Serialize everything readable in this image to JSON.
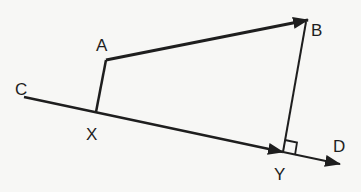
{
  "diagram": {
    "type": "geometry",
    "points": {
      "A": {
        "label": "A",
        "x": 106,
        "y": 60,
        "lx": 96,
        "ly": 51
      },
      "B": {
        "label": "B",
        "x": 308,
        "y": 20,
        "lx": 311,
        "ly": 36
      },
      "C": {
        "label": "C",
        "x": 24,
        "y": 97,
        "lx": 15,
        "ly": 95
      },
      "X": {
        "label": "X",
        "x": 96,
        "y": 112,
        "lx": 86,
        "ly": 140
      },
      "Y": {
        "label": "Y",
        "x": 283,
        "y": 152,
        "lx": 274,
        "ly": 180
      },
      "D": {
        "label": "D",
        "x": 340,
        "y": 164,
        "lx": 333,
        "ly": 152
      }
    },
    "segments": [
      {
        "from": "X",
        "to": "A",
        "arrow": false,
        "name": "segment-XA"
      },
      {
        "from": "A",
        "to": "B",
        "arrow": true,
        "name": "vector-AB"
      },
      {
        "from": "Y",
        "to": "B",
        "arrow": false,
        "name": "segment-YB"
      },
      {
        "from": "C",
        "to": "Y",
        "arrow": true,
        "name": "line-CY"
      },
      {
        "from": "Y",
        "to": "D",
        "arrow": true,
        "name": "line-YD"
      }
    ],
    "right_angle_at": "Y",
    "stroke_color": "#1e1e1e",
    "background": "#f7f7f5"
  }
}
